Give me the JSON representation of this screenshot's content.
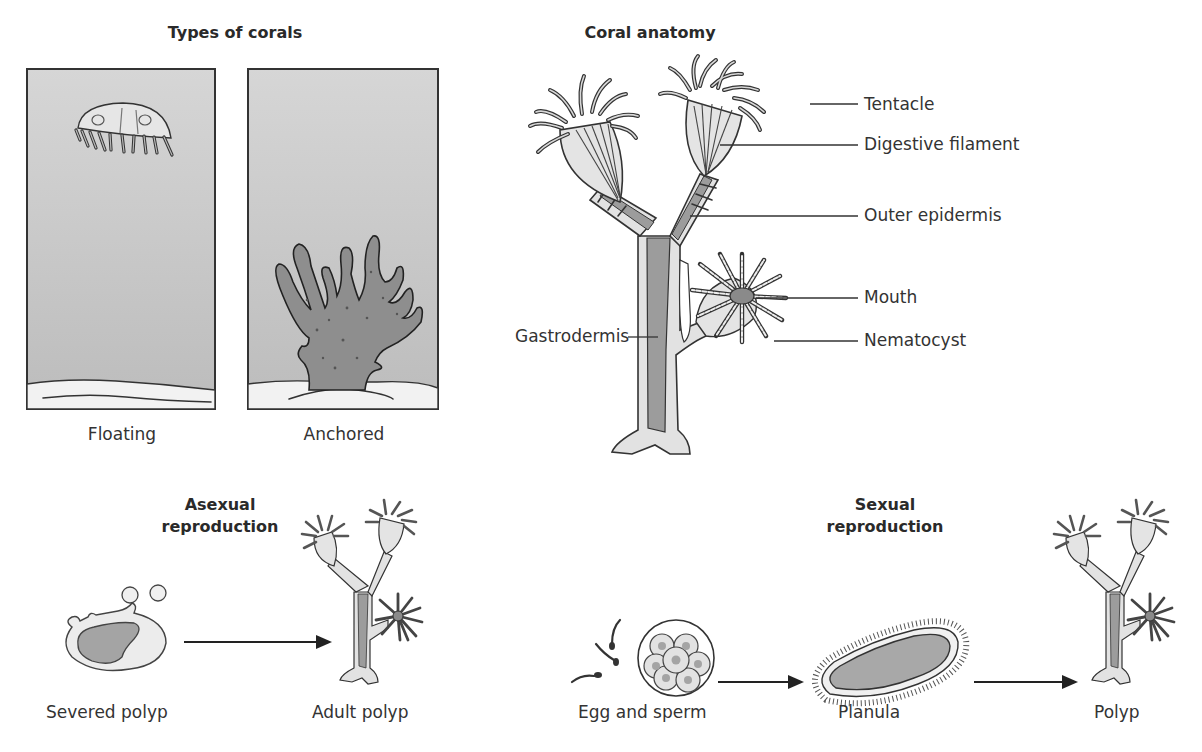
{
  "types_of_corals": {
    "title": "Types of corals",
    "panels": [
      {
        "label": "Floating",
        "organism": "jellyfish-medusa"
      },
      {
        "label": "Anchored",
        "organism": "branching-coral"
      }
    ]
  },
  "coral_anatomy": {
    "title": "Coral anatomy",
    "labels": [
      {
        "text": "Tentacle",
        "side": "right"
      },
      {
        "text": "Digestive filament",
        "side": "right"
      },
      {
        "text": "Outer epidermis",
        "side": "right"
      },
      {
        "text": "Mouth",
        "side": "right"
      },
      {
        "text": "Nematocyst",
        "side": "right"
      },
      {
        "text": "Gastrodermis",
        "side": "left"
      }
    ]
  },
  "asexual_reproduction": {
    "title_line1": "Asexual",
    "title_line2": "reproduction",
    "stages": [
      {
        "label": "Severed polyp"
      },
      {
        "label": "Adult polyp"
      }
    ]
  },
  "sexual_reproduction": {
    "title_line1": "Sexual",
    "title_line2": "reproduction",
    "stages": [
      {
        "label": "Egg and sperm"
      },
      {
        "label": "Planula"
      },
      {
        "label": "Polyp"
      }
    ]
  },
  "colors": {
    "water": "#c8c8c8",
    "sand": "#f2f2f2",
    "tissue_dark": "#9a9a9a",
    "tissue_light": "#e0e0e0",
    "ink": "#333333"
  }
}
